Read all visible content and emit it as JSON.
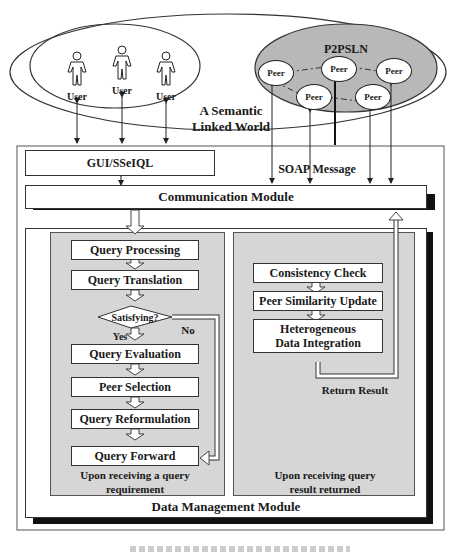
{
  "world": {
    "title_line1": "A Semantic",
    "title_line2": "Linked World",
    "users": [
      {
        "label": "User"
      },
      {
        "label": "User"
      },
      {
        "label": "User"
      }
    ],
    "p2psln": {
      "title": "P2PSLN",
      "peers": [
        {
          "label": "Peer"
        },
        {
          "label": "Peer"
        },
        {
          "label": "Peer"
        },
        {
          "label": "Peer"
        },
        {
          "label": "Peer"
        }
      ]
    }
  },
  "interface": {
    "gui_label": "GUI/SSeIQL",
    "soap_label": "SOAP Message",
    "communication_module": "Communication Module"
  },
  "data_management": {
    "title": "Data Management Module",
    "query_panel": {
      "steps": [
        "Query Processing",
        "Query Translation",
        "Query Evaluation",
        "Peer Selection",
        "Query Reformulation",
        "Query Forward"
      ],
      "decision": "Satisfying?",
      "yes_label": "Yes",
      "no_label": "No",
      "caption_line1": "Upon receiving a query",
      "caption_line2": "requirement"
    },
    "result_panel": {
      "steps": [
        "Consistency Check",
        "Peer Similarity Update",
        "Heterogeneous Data Integration"
      ],
      "step3_line1": "Heterogeneous",
      "step3_line2": "Data Integration",
      "return_label": "Return Result",
      "caption_line1": "Upon receiving query",
      "caption_line2": "result returned"
    }
  },
  "colors": {
    "panel_gray": "#d6d6d6",
    "p2psln_gray": "#b8b8b8",
    "shadow": "#111111"
  }
}
